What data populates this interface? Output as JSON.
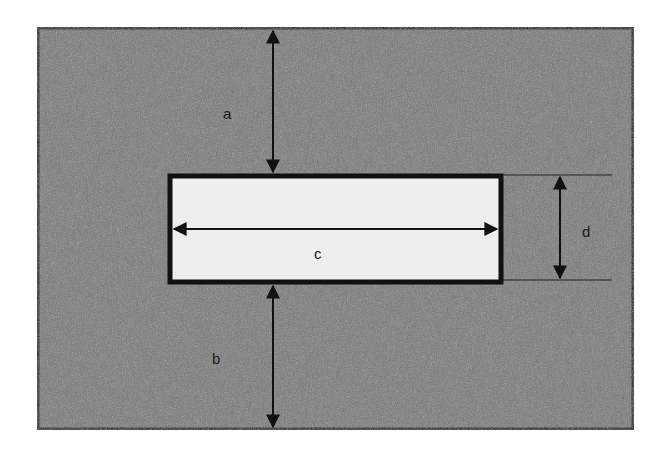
{
  "diagram": {
    "type": "dimension-drawing",
    "outer_region": {
      "fill": "#7a7a7a",
      "border": "#111111"
    },
    "inner_region": {
      "fill": "#eeeeee",
      "border": "#111111"
    },
    "dimensions": [
      {
        "id": "a",
        "label": "a",
        "description": "distance from top of outer frame to top of inner rectangle"
      },
      {
        "id": "b",
        "label": "b",
        "description": "distance from bottom of inner rectangle to bottom of outer frame"
      },
      {
        "id": "c",
        "label": "c",
        "description": "width of inner rectangle"
      },
      {
        "id": "d",
        "label": "d",
        "description": "height of inner rectangle"
      }
    ]
  }
}
